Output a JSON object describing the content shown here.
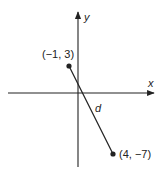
{
  "diagram": {
    "type": "coordinate-plane-distance",
    "axes": {
      "x_label": "x",
      "y_label": "y"
    },
    "points": [
      {
        "label": "(−1, 3)",
        "x": -1,
        "y": 3
      },
      {
        "label": "(4, −7)",
        "x": 4,
        "y": -7
      }
    ],
    "segment_label": "d",
    "colors": {
      "ink": "#222222",
      "background": "#ffffff"
    }
  }
}
